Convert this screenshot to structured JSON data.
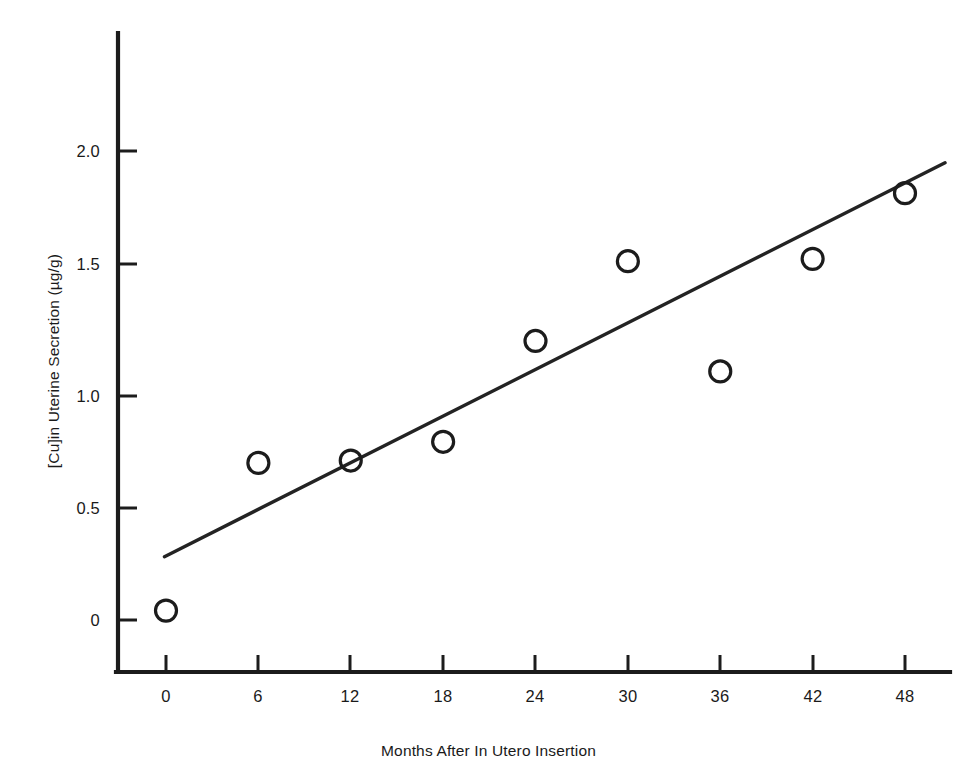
{
  "figure": {
    "cropped_caption_sliver": "",
    "background_color": "#ffffff",
    "ink_color": "#1c1c1c"
  },
  "chart_data": {
    "type": "scatter",
    "title": "",
    "subtitle": "",
    "xlabel": "Months After In Utero Insertion",
    "ylabel": "[Cu]in Uterine Secretion (µg/g)",
    "xlim": [
      -3,
      51
    ],
    "ylim": [
      0,
      2.25
    ],
    "grid": false,
    "legend": false,
    "legend_position": "none",
    "marker_style": "open-circle",
    "x": [
      0,
      6,
      12,
      18,
      24,
      30,
      36,
      42,
      48
    ],
    "values": [
      0.04,
      0.67,
      0.68,
      0.76,
      1.19,
      1.53,
      1.06,
      1.54,
      1.82
    ],
    "points": [
      {
        "x": 0,
        "y": 0.04
      },
      {
        "x": 6,
        "y": 0.67
      },
      {
        "x": 12,
        "y": 0.68
      },
      {
        "x": 18,
        "y": 0.76
      },
      {
        "x": 24,
        "y": 1.19
      },
      {
        "x": 30,
        "y": 1.53
      },
      {
        "x": 36,
        "y": 1.06
      },
      {
        "x": 42,
        "y": 1.54
      },
      {
        "x": 48,
        "y": 1.82
      }
    ],
    "trend_line": {
      "type": "linear-fit",
      "x_start": -0.1,
      "y_start": 0.27,
      "x_end": 50.6,
      "y_end": 1.95
    },
    "xticks": [
      0,
      6,
      12,
      18,
      24,
      30,
      36,
      42,
      48
    ],
    "xticklabels": [
      "0",
      "6",
      "12",
      "18",
      "24",
      "30",
      "36",
      "42",
      "48"
    ],
    "yticks": [
      0,
      0.5,
      1.0,
      1.5,
      2.0
    ],
    "yticklabels": [
      "0",
      "0.5",
      "1.0",
      "1.5",
      "2.0"
    ],
    "tick_direction": "in",
    "axis_style": "left-and-bottom-spines"
  }
}
